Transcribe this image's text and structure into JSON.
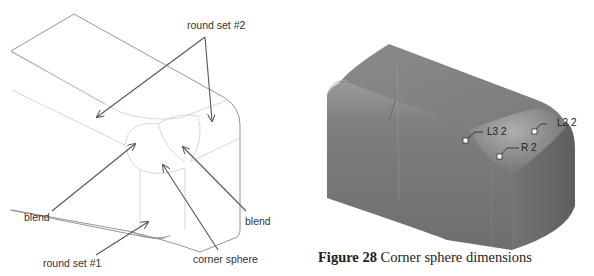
{
  "left_figure": {
    "labels": {
      "round_set_2": "round set #2",
      "blend_left": "blend",
      "blend_right": "blend",
      "corner_sphere": "corner sphere",
      "round_set_1": "round set #1"
    },
    "colors": {
      "edge": "#8a8a8a",
      "faint_edge": "#d0d0d0",
      "arrow": "#555555"
    }
  },
  "right_figure": {
    "dimensions": {
      "l3": "L3 2",
      "l2": "L2 2",
      "r": "R 2"
    },
    "colors": {
      "surface": "#7c7c7c",
      "highlight": "#a8a8a8",
      "shadow": "#5e5e5e"
    }
  },
  "caption": {
    "figure_number": "Figure 28",
    "text": " Corner sphere dimensions"
  }
}
